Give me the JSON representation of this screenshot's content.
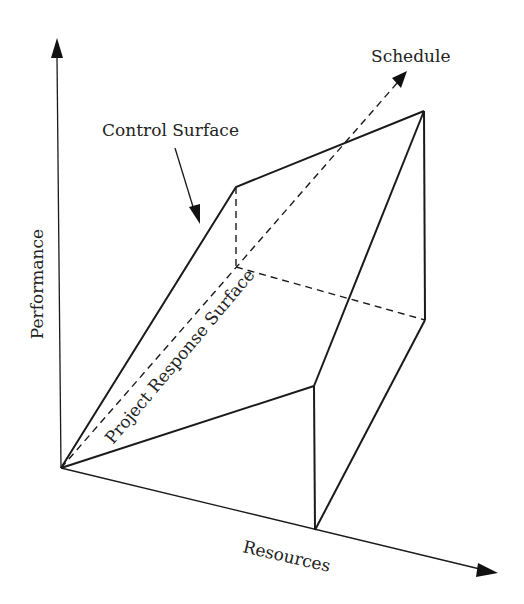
{
  "diagram": {
    "type": "3d-axes-surface",
    "axes": {
      "performance": "Performance",
      "resources": "Resources",
      "schedule": "Schedule"
    },
    "labels": {
      "control_surface": "Control Surface",
      "project_response_surface": "Project Response Surface"
    },
    "colors": {
      "line": "#1a1a1a",
      "background": "#ffffff"
    }
  }
}
